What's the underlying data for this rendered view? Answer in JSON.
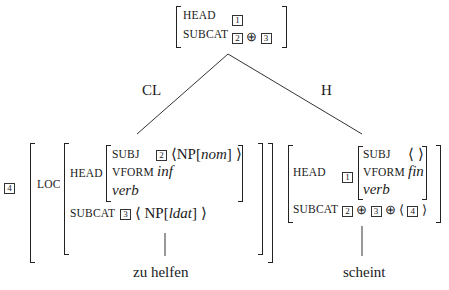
{
  "root": {
    "rows": [
      {
        "feature": "HEAD",
        "value_tags": [
          "1"
        ]
      },
      {
        "feature": "SUBCAT",
        "value_tags": [
          "2",
          "3"
        ],
        "operator": "⊕"
      }
    ]
  },
  "branches": {
    "left_label": "CL",
    "right_label": "H"
  },
  "left": {
    "tag": "4",
    "loc_label": "LOC",
    "head_label": "HEAD",
    "subj_label": "SUBJ",
    "subj_tag": "2",
    "subj_value": "NP[nom]",
    "subj_np": "NP[",
    "subj_case": "nom",
    "vform_label": "VFORM",
    "vform_value": "inf",
    "type": "verb",
    "subcat_label": "SUBCAT",
    "subcat_tag": "3",
    "subcat_np": "NP[",
    "subcat_case": "ldat",
    "word": "zu helfen"
  },
  "right": {
    "head_label": "HEAD",
    "head_tag": "1",
    "subj_label": "SUBJ",
    "subj_value": "⟨ ⟩",
    "vform_label": "VFORM",
    "vform_value": "fin",
    "type": "verb",
    "subcat_label": "SUBCAT",
    "subcat_tags": [
      "2",
      "3"
    ],
    "subcat_list_tag": "4",
    "operator": "⊕",
    "word": "scheint"
  },
  "symbols": {
    "langle": "⟨",
    "rangle": "⟩",
    "rbracket": "]"
  }
}
